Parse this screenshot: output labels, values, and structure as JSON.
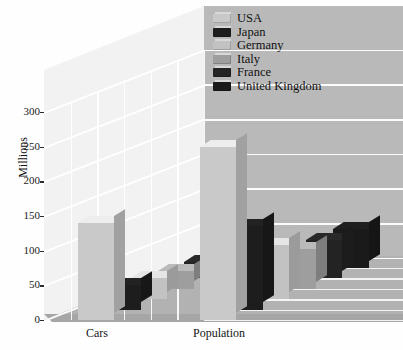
{
  "chart_data": {
    "type": "bar",
    "title": "",
    "subtitle": "",
    "xlabel": "",
    "ylabel": "Millions",
    "categories": [
      "Cars",
      "Population"
    ],
    "ylim": [
      0,
      300
    ],
    "ytick_values": [
      0,
      50,
      100,
      150,
      200,
      250,
      300
    ],
    "ytick_labels": [
      "0",
      "50",
      "100",
      "150",
      "200",
      "250",
      "300"
    ],
    "grid": true,
    "projection": "3d",
    "legend_position": "top-right",
    "series": [
      {
        "name": "USA",
        "color": "#c9c9c9",
        "values": [
          140,
          250
        ]
      },
      {
        "name": "Japan",
        "color": "#1d1d1d",
        "values": [
          35,
          120
        ]
      },
      {
        "name": "Germany",
        "color": "#c2c2c2",
        "values": [
          30,
          78
        ]
      },
      {
        "name": "Italy",
        "color": "#9e9e9e",
        "values": [
          25,
          57
        ]
      },
      {
        "name": "France",
        "color": "#232323",
        "values": [
          23,
          55
        ]
      },
      {
        "name": "United Kingdom",
        "color": "#1a1a1a",
        "values": [
          22,
          56
        ]
      }
    ]
  },
  "legend": {
    "items": [
      {
        "label": "USA"
      },
      {
        "label": "Japan"
      },
      {
        "label": "Germany"
      },
      {
        "label": "Italy"
      },
      {
        "label": "France"
      },
      {
        "label": "United Kingdom"
      }
    ]
  },
  "axes": {
    "y_title": "Millions",
    "y_ticks": [
      "300",
      "250",
      "200",
      "150",
      "100",
      "50",
      "0"
    ],
    "x_ticks": [
      "Cars",
      "Population"
    ]
  },
  "colors": {
    "back_wall_left": "#f2f2f2",
    "back_wall_right": "#b9b9b9",
    "floor": "#b2b2b2",
    "gridline": "#ffffff",
    "text": "#111111"
  }
}
